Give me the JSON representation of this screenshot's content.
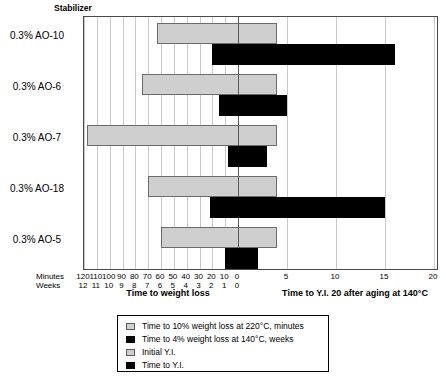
{
  "header": {
    "stabilizer_label": "Stabilizer"
  },
  "axis": {
    "minutes_row_label": "Minutes",
    "weeks_row_label": "Weeks",
    "left_title": "Time to weight loss",
    "right_title": "Time to Y.I. 20 after aging at 140°C",
    "minutes_ticks": [
      "120",
      "110",
      "100",
      "90",
      "80",
      "70",
      "60",
      "50",
      "40",
      "30",
      "20",
      "10",
      "0"
    ],
    "weeks_ticks": [
      "12",
      "11",
      "10",
      "9",
      "8",
      "7",
      "6",
      "5",
      "4",
      "3",
      "2",
      "1",
      "0"
    ],
    "right_ticks": [
      "5",
      "10",
      "15",
      "20"
    ]
  },
  "legend": {
    "items": [
      {
        "swatch": "gray",
        "label": "Time to 10% weight loss at 220°C, minutes"
      },
      {
        "swatch": "black",
        "label": "Time to 4% weight loss at 140°C, weeks"
      },
      {
        "swatch": "gray",
        "label": "Initial Y.I."
      },
      {
        "swatch": "black",
        "label": "Time to Y.I."
      }
    ]
  },
  "colors": {
    "gray_bar": "#cfcfcf",
    "black_bar": "#000000",
    "gridline": "#c9c9c9",
    "zero_line": "#5a5a5a",
    "frame": "#4a4a4a"
  },
  "chart_data": {
    "type": "bar",
    "orientation": "horizontal",
    "title": "",
    "categories": [
      "0.3% AO-10",
      "0.3% AO-6",
      "0.3% AO-7",
      "0.3% AO-18",
      "0.3% AO-5"
    ],
    "xlabel_left": "Time to weight loss",
    "xlabel_right": "Time to Y.I. 20 after aging at 140°C",
    "ylabel": "Stabilizer",
    "grid": true,
    "legend_position": "bottom",
    "axes": {
      "left_minutes": {
        "label": "Minutes",
        "range": [
          0,
          120
        ],
        "ticks": [
          120,
          110,
          100,
          90,
          80,
          70,
          60,
          50,
          40,
          30,
          20,
          10,
          0
        ],
        "direction": "right-to-left"
      },
      "left_weeks": {
        "label": "Weeks",
        "range": [
          0,
          12
        ],
        "ticks": [
          12,
          11,
          10,
          9,
          8,
          7,
          6,
          5,
          4,
          3,
          2,
          1,
          0
        ],
        "direction": "right-to-left"
      },
      "right_yi": {
        "label": "Time to Y.I. 20",
        "range": [
          0,
          20
        ],
        "ticks": [
          0,
          5,
          10,
          15,
          20
        ],
        "direction": "left-to-right"
      }
    },
    "series": [
      {
        "name": "Time to 10% weight loss at 220°C, minutes",
        "swatch": "gray",
        "axis": "left_minutes",
        "units": "minutes",
        "values": [
          63,
          75,
          118,
          70,
          60
        ]
      },
      {
        "name": "Time to 4% weight loss at 140°C, weeks",
        "swatch": "black",
        "axis": "left_weeks",
        "units": "weeks",
        "values": [
          2.0,
          1.5,
          0.8,
          2.2,
          1.0
        ]
      },
      {
        "name": "Initial Y.I.",
        "swatch": "gray",
        "axis": "right_yi",
        "units": "Y.I.",
        "values": [
          4,
          4,
          4,
          4,
          4
        ]
      },
      {
        "name": "Time to Y.I.",
        "swatch": "black",
        "axis": "right_yi",
        "units": "Y.I.",
        "values": [
          16,
          5,
          3,
          15,
          2
        ]
      }
    ]
  },
  "geometry": {
    "plot": {
      "left": 83,
      "top": 16,
      "width": 355,
      "height": 254
    },
    "zero_x": 237,
    "px_per_minute": 1.2833,
    "px_per_yi_unit": 9.8,
    "rows": [
      {
        "gray_top": 22,
        "black_top": 43
      },
      {
        "gray_top": 73,
        "black_top": 94
      },
      {
        "gray_top": 124,
        "black_top": 145
      },
      {
        "gray_top": 175,
        "black_top": 196
      },
      {
        "gray_top": 226,
        "black_top": 247
      }
    ],
    "bar_height": 21,
    "label_tops": [
      30,
      81,
      132,
      183,
      234
    ]
  }
}
